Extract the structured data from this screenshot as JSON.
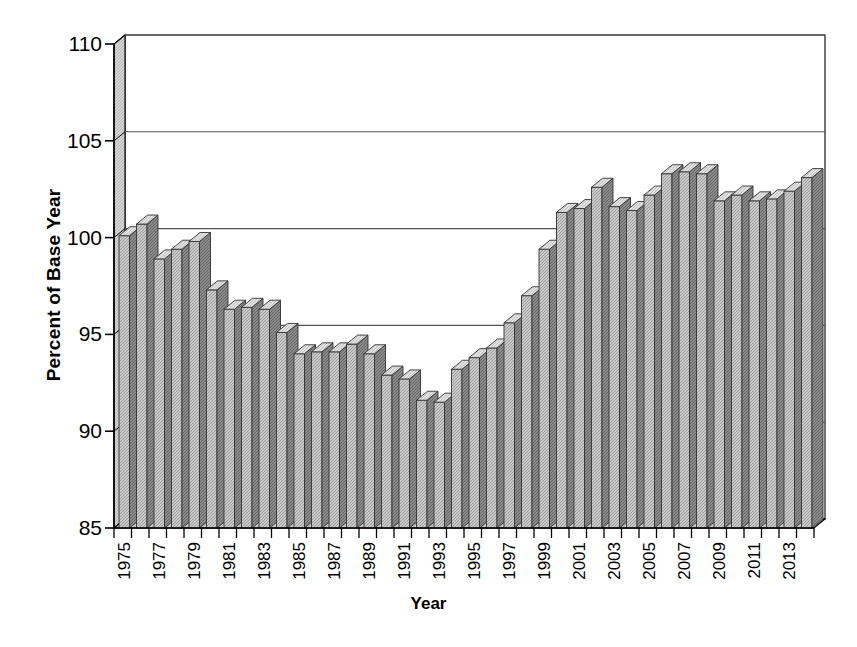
{
  "chart_data": {
    "type": "bar",
    "title": "",
    "subtitle": "",
    "xlabel": "Year",
    "ylabel": "Percent of Base Year",
    "ylim": [
      85,
      110
    ],
    "yticks": [
      85,
      90,
      95,
      100,
      105,
      110
    ],
    "ytick_labels": [
      "85",
      "90",
      "95",
      "100",
      "105",
      "110"
    ],
    "grid": true,
    "legend": null,
    "style": "3d-column",
    "bar_color": "#c9c9c9",
    "bar_side_color": "#8a8a8a",
    "bar_top_color": "#e2e2e2",
    "axis_color": "#000000",
    "gridline_color": "#555555",
    "wall_color": "#d4d4d4",
    "floor_color": "#cfcfcf",
    "categories": [
      "1975",
      "1976",
      "1977",
      "1978",
      "1979",
      "1980",
      "1981",
      "1982",
      "1983",
      "1984",
      "1985",
      "1986",
      "1987",
      "1988",
      "1989",
      "1990",
      "1991",
      "1992",
      "1993",
      "1994",
      "1995",
      "1996",
      "1997",
      "1998",
      "1999",
      "2000",
      "2001",
      "2002",
      "2003",
      "2004",
      "2005",
      "2006",
      "2007",
      "2008",
      "2009",
      "2010",
      "2011",
      "2012",
      "2013",
      "2014"
    ],
    "xtick_labels": [
      "1975",
      "",
      "1977",
      "",
      "1979",
      "",
      "1981",
      "",
      "1983",
      "",
      "1985",
      "",
      "1987",
      "",
      "1989",
      "",
      "1991",
      "",
      "1993",
      "",
      "1995",
      "",
      "1997",
      "",
      "1999",
      "",
      "2001",
      "",
      "2003",
      "",
      "2005",
      "",
      "2007",
      "",
      "2009",
      "",
      "2011",
      "",
      "2013",
      ""
    ],
    "values": [
      100.1,
      100.7,
      98.9,
      99.4,
      99.8,
      97.3,
      96.3,
      96.4,
      96.3,
      95.1,
      94.0,
      94.1,
      94.1,
      94.5,
      94.0,
      92.9,
      92.7,
      91.6,
      91.5,
      93.2,
      93.8,
      94.3,
      95.6,
      97.0,
      99.4,
      101.3,
      101.5,
      102.6,
      101.6,
      101.4,
      102.2,
      103.3,
      103.4,
      103.3,
      101.9,
      102.2,
      101.9,
      102.0,
      102.4,
      103.1
    ]
  }
}
